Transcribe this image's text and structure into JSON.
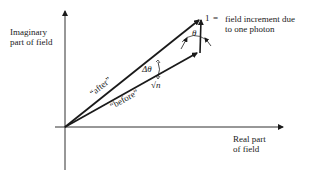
{
  "diagram": {
    "type": "phasor-vector-diagram",
    "axes": {
      "y_label_line1": "Imaginary",
      "y_label_line2": "part of field",
      "x_label_line1": "Real part",
      "x_label_line2": "of field"
    },
    "vectors": {
      "after_label": "“after”",
      "before_label": "“before”",
      "before_magnitude": "√n",
      "delta_theta_label": "Δθ",
      "theta_label": "θ"
    },
    "increment": {
      "symbol": "1",
      "equals": "=",
      "description_line1": "field increment due",
      "description_line2": "to one photon"
    },
    "colors": {
      "ink": "#1a1a1a",
      "background": "#ffffff"
    }
  }
}
